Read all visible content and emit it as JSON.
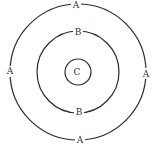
{
  "diagram": {
    "type": "concentric-circles",
    "center": {
      "x": 78,
      "y": 72
    },
    "rings": [
      {
        "id": "outer",
        "label": "A",
        "radius": 68
      },
      {
        "id": "middle",
        "label": "B",
        "radius": 42
      },
      {
        "id": "inner",
        "label": "C",
        "radius": 13
      }
    ],
    "labels": {
      "outer_top": "A",
      "outer_bottom": "A",
      "outer_left": "A",
      "outer_right": "A",
      "middle_top": "B",
      "middle_bottom": "B",
      "inner_center": "C"
    },
    "colors": {
      "stroke": "#2a2a2a",
      "text": "#333333",
      "background": "#ffffff"
    }
  }
}
